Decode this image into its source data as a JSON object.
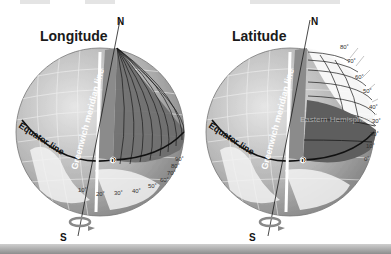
{
  "left_diagram": {
    "title": "Longitude",
    "north_label": "N",
    "south_label": "S",
    "meridian_label": "Greenwich meridian line",
    "equator_label": "Equator line",
    "origin_label": "0",
    "degree_labels": [
      "10˚",
      "20˚",
      "30˚",
      "40˚",
      "50˚",
      "60˚",
      "70˚",
      "80˚",
      "90˚"
    ]
  },
  "right_diagram": {
    "title": "Latitude",
    "north_label": "N",
    "south_label": "S",
    "meridian_label": "Greenwich meridian line",
    "equator_label": "Equator line",
    "origin_label": "0",
    "hemisphere_label": "Eastern Hemisphere",
    "degree_labels": [
      "0˚",
      "10˚",
      "20˚",
      "30˚",
      "40˚",
      "50˚",
      "60˚",
      "70˚",
      "80˚"
    ]
  },
  "colors": {
    "globe_light": "#d9d9d9",
    "globe_mid": "#9a9a9a",
    "globe_dark": "#5a5a5a",
    "wedge_dark": "#6e6e6e",
    "line": "#1a1a1a",
    "bottom_bar": "#a9a9a9"
  }
}
